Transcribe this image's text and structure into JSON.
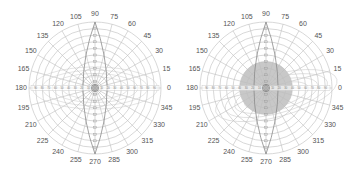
{
  "chart_data": [
    {
      "type": "polar",
      "title": "",
      "angle_ticks": [
        0,
        15,
        30,
        45,
        60,
        75,
        90,
        105,
        120,
        135,
        150,
        165,
        180,
        195,
        210,
        225,
        240,
        255,
        270,
        285,
        300,
        315,
        330,
        345
      ],
      "angle_unit": "degrees",
      "rings": 10,
      "grid": true,
      "radial_axis_labels": [
        "0",
        "10",
        "20",
        "30",
        "40",
        "50",
        "60",
        "70",
        "80",
        "90"
      ],
      "series": [
        {
          "name": "vertical-lobe",
          "shape": "lens",
          "axis_angle": 90,
          "half_width_deg": 8,
          "extent": 1.0
        },
        {
          "name": "side-ellipses",
          "shape": "ellipse-family",
          "note": "faint curves spanning the 150-210 and 330-30 regions"
        }
      ],
      "center_marker": "concentric small circles"
    },
    {
      "type": "polar",
      "title": "",
      "angle_ticks": [
        0,
        15,
        30,
        45,
        60,
        75,
        90,
        105,
        120,
        135,
        150,
        165,
        180,
        195,
        210,
        225,
        240,
        255,
        270,
        285,
        300,
        315,
        330,
        345
      ],
      "angle_unit": "degrees",
      "rings": 10,
      "grid": true,
      "radial_axis_labels": [
        "0",
        "10",
        "20",
        "30",
        "40",
        "50",
        "60",
        "70",
        "80",
        "90"
      ],
      "series": [
        {
          "name": "vertical-lobe",
          "shape": "lens",
          "axis_angle": 90,
          "half_width_deg": 8,
          "extent": 1.0
        },
        {
          "name": "dense-core",
          "shape": "filled-disk",
          "radius_fraction": 0.4,
          "fill": "#9a9a9a"
        },
        {
          "name": "offset-ellipses",
          "shape": "ellipse-family",
          "note": "curves extending toward 315-345 region"
        }
      ],
      "center_marker": "concentric small circles"
    }
  ],
  "colors": {
    "grid": "#bdbdbd",
    "lobe": "#8a8a8a",
    "core": "#9a9a9a",
    "text": "#555555"
  }
}
